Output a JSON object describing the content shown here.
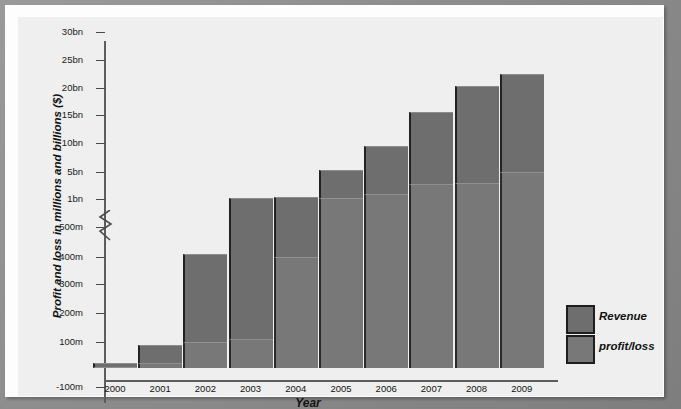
{
  "chart_data": {
    "type": "bar",
    "title": "",
    "xlabel": "Year",
    "ylabel": "Profit and loss in millions and billions ($)",
    "stacked": true,
    "axis_break": {
      "below": "500m",
      "above": "1bn"
    },
    "grid": false,
    "legend_position": "right",
    "categories": [
      "2000",
      "2001",
      "2002",
      "2003",
      "2004",
      "2005",
      "2006",
      "2007",
      "2008",
      "2009"
    ],
    "y_tick_labels": [
      "30bn",
      "25bn",
      "20bn",
      "15bn",
      "10bn",
      "5bn",
      "1bn",
      "500m",
      "400m",
      "300m",
      "200m",
      "100m",
      "-100m"
    ],
    "ylim": [
      "-100m",
      "30bn"
    ],
    "series": [
      {
        "name": "Revenue",
        "color": "#6e6e6e",
        "values": [
          20000000,
          90000000,
          410000000,
          1100000000,
          1250000000,
          5300000000,
          9500000000,
          15500000000,
          20300000000,
          22500000000
        ],
        "value_labels": [
          "20m",
          "90m",
          "410m",
          "1.1bn",
          "1.25bn",
          "5.3bn",
          "9.5bn",
          "15.5bn",
          "20.3bn",
          "22.5bn"
        ]
      },
      {
        "name": "profit/loss",
        "color": "#787878",
        "values": [
          5000000,
          20000000,
          100000000,
          110000000,
          400000000,
          1200000000,
          1700000000,
          3200000000,
          3300000000,
          5000000000
        ],
        "value_labels": [
          "5m",
          "20m",
          "100m",
          "110m",
          "400m",
          "1.2bn",
          "1.7bn",
          "3.2bn",
          "3.3bn",
          "5bn"
        ]
      }
    ]
  },
  "legend": {
    "items": [
      {
        "label": "Revenue",
        "color": "#6e6e6e"
      },
      {
        "label": "profit/loss",
        "color": "#787878"
      }
    ]
  }
}
